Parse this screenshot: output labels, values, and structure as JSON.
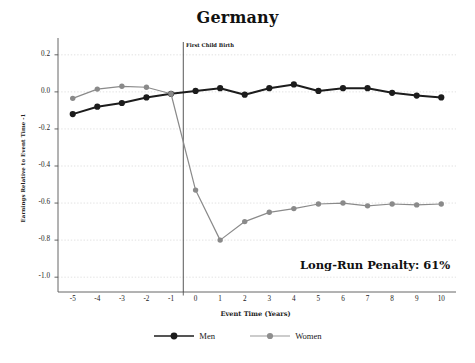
{
  "chart_data": {
    "type": "line",
    "title": "Germany",
    "xlabel": "Event Time (Years)",
    "ylabel": "Earnings Relative to Event Time -1",
    "xlim": [
      -5.6,
      10.6
    ],
    "ylim": [
      -1.08,
      0.28
    ],
    "grid": true,
    "grid_axis": "y",
    "legend_position": "bottom",
    "x": [
      -5,
      -4,
      -3,
      -2,
      -1,
      0,
      1,
      2,
      3,
      4,
      5,
      6,
      7,
      8,
      9,
      10
    ],
    "xticks": [
      "-5",
      "-4",
      "-3",
      "-2",
      "-1",
      "0",
      "1",
      "2",
      "3",
      "4",
      "5",
      "6",
      "7",
      "8",
      "9",
      "10"
    ],
    "yticks": [
      "0.2",
      "0.0",
      "-0.2",
      "-0.4",
      "-0.6",
      "-0.8",
      "-1.0"
    ],
    "ytickvalues": [
      0.2,
      0.0,
      -0.2,
      -0.4,
      -0.6,
      -0.8,
      -1.0
    ],
    "series": [
      {
        "name": "Men",
        "color": "#1c1c1c",
        "values": [
          -0.12,
          -0.08,
          -0.06,
          -0.03,
          -0.01,
          0.005,
          0.02,
          -0.015,
          0.02,
          0.04,
          0.005,
          0.02,
          0.02,
          -0.005,
          -0.02,
          -0.03
        ]
      },
      {
        "name": "Women",
        "color": "#8a8a8a",
        "values": [
          -0.035,
          0.015,
          0.03,
          0.025,
          -0.01,
          -0.53,
          -0.8,
          -0.7,
          -0.65,
          -0.63,
          -0.605,
          -0.6,
          -0.615,
          -0.605,
          -0.61,
          -0.605
        ]
      }
    ],
    "annotations": [
      {
        "name": "event-line",
        "label": "First Child Birth",
        "x": -0.5,
        "type": "vline"
      },
      {
        "name": "long-run-penalty",
        "label": "Long-Run Penalty: 61%"
      }
    ]
  },
  "legend": {
    "items": [
      {
        "label": "Men"
      },
      {
        "label": "Women"
      }
    ]
  }
}
